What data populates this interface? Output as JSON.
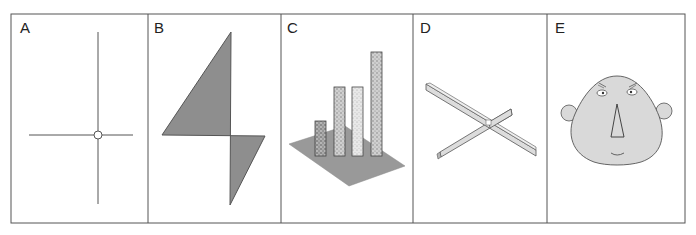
{
  "figure": {
    "panels": [
      {
        "id": "A",
        "label": "A",
        "content": "crosshair with small circle at intersection"
      },
      {
        "id": "B",
        "label": "B",
        "content": "grey filled kite-shaped quadrilateral"
      },
      {
        "id": "C",
        "label": "C",
        "content": "3D bar chart of four stippled bars on grey plane"
      },
      {
        "id": "D",
        "label": "D",
        "content": "two crossing thin 3D slabs"
      },
      {
        "id": "E",
        "label": "E",
        "content": "cartoon face with ears, eyes, triangular nose and smile"
      }
    ],
    "colors": {
      "border": "#555555",
      "line": "#555555",
      "fill_dark_grey": "#8e8e8e",
      "fill_plane_grey": "#999999",
      "fill_face": "#d9d9d9",
      "fill_slab": "#dcdcdc"
    }
  }
}
